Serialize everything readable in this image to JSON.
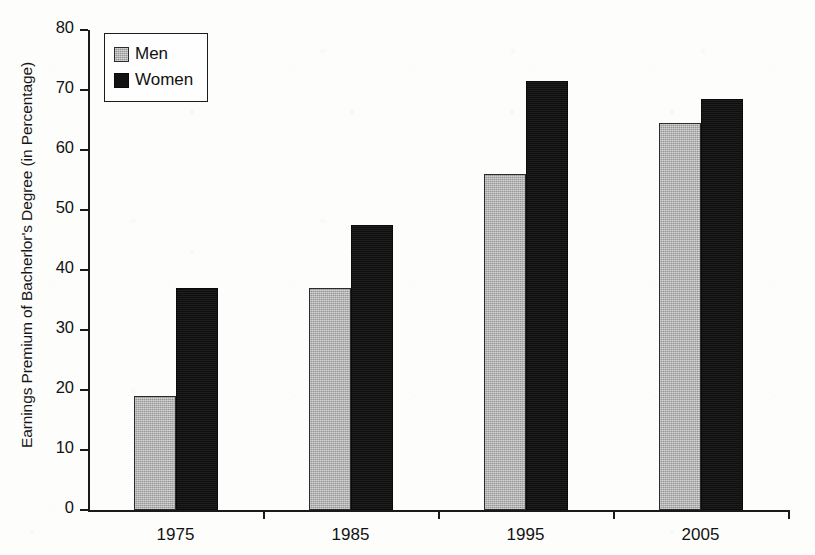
{
  "chart_data": {
    "type": "bar",
    "title": "",
    "xlabel": "",
    "ylabel": "Earnings Premium of Bacherlor's Degree (in Percentage)",
    "categories": [
      "1975",
      "1985",
      "1995",
      "2005"
    ],
    "series": [
      {
        "name": "Men",
        "color": "#ababab",
        "values": [
          19,
          37,
          56,
          64.5
        ]
      },
      {
        "name": "Women",
        "color": "#121212",
        "values": [
          37,
          47.5,
          71.5,
          68.5
        ]
      }
    ],
    "ylim": [
      0,
      80
    ],
    "ytick_values": [
      0,
      10,
      20,
      30,
      40,
      50,
      60,
      70,
      80
    ],
    "ytick_labels": [
      "0",
      "10",
      "20",
      "30",
      "40",
      "50",
      "60",
      "70",
      "80"
    ],
    "grid": false,
    "legend_position": "top-left",
    "legend_entries": [
      "Men",
      "Women"
    ]
  }
}
